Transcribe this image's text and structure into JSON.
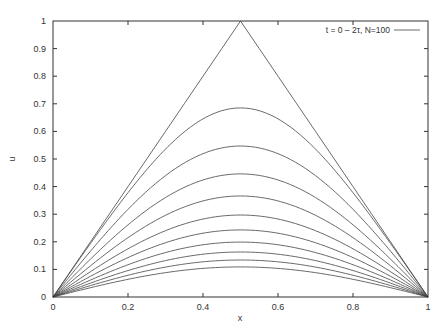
{
  "chart_data": {
    "type": "line",
    "title": "",
    "xlabel": "x",
    "ylabel": "u",
    "xlim": [
      0,
      1
    ],
    "ylim": [
      0,
      1
    ],
    "grid": false,
    "legend": {
      "placement": "top-right",
      "entries": [
        "t = 0 –  2τ, N=100"
      ]
    },
    "xticks": [
      0,
      0.2,
      0.4,
      0.6,
      0.8,
      1
    ],
    "xtick_labels": [
      "0",
      "0.2",
      "0.4",
      "0.6",
      "0.8",
      "1"
    ],
    "yticks": [
      0,
      0.1,
      0.2,
      0.3,
      0.4,
      0.5,
      0.6,
      0.7,
      0.8,
      0.9,
      1
    ],
    "ytick_labels": [
      "0",
      "0.1",
      "0.2",
      "0.3",
      "0.4",
      "0.5",
      "0.6",
      "0.7",
      "0.8",
      "0.9",
      "1"
    ],
    "x": [
      0,
      0.05,
      0.1,
      0.15,
      0.2,
      0.25,
      0.3,
      0.35,
      0.4,
      0.45,
      0.5,
      0.55,
      0.6,
      0.65,
      0.7,
      0.75,
      0.8,
      0.85,
      0.9,
      0.95,
      1
    ],
    "series": [
      {
        "name": "u0",
        "peak": 1.0,
        "values": [
          0,
          0.1,
          0.2,
          0.3,
          0.4,
          0.5,
          0.6,
          0.7,
          0.8,
          0.9,
          1.0,
          0.9,
          0.8,
          0.7,
          0.6,
          0.5,
          0.4,
          0.3,
          0.2,
          0.1,
          0
        ]
      },
      {
        "name": "u1",
        "peak": 0.685
      },
      {
        "name": "u2",
        "peak": 0.547
      },
      {
        "name": "u3",
        "peak": 0.446
      },
      {
        "name": "u4",
        "peak": 0.366
      },
      {
        "name": "u5",
        "peak": 0.297
      },
      {
        "name": "u6",
        "peak": 0.243
      },
      {
        "name": "u7",
        "peak": 0.199
      },
      {
        "name": "u8",
        "peak": 0.163
      },
      {
        "name": "u9",
        "peak": 0.134
      },
      {
        "name": "u10",
        "peak": 0.109
      }
    ]
  }
}
